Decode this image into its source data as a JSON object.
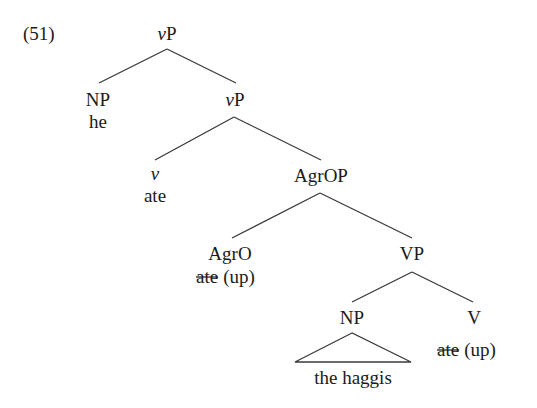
{
  "example_number": "(51)",
  "tree": {
    "root": {
      "cat_italic": "v",
      "cat_rest": "P"
    },
    "spec": {
      "label": "NP",
      "word": "he"
    },
    "vP2": {
      "cat_italic": "v",
      "cat_rest": "P"
    },
    "v_head": {
      "label": "v",
      "word": "ate"
    },
    "agrop": {
      "label": "AgrOP"
    },
    "agro": {
      "label": "AgrO",
      "struck_word": "ate",
      "particle": "(up)"
    },
    "vp": {
      "label": "VP"
    },
    "object": {
      "label": "NP",
      "word": "the haggis"
    },
    "verb": {
      "label": "V",
      "struck_word": "ate",
      "particle": "(up)"
    }
  }
}
